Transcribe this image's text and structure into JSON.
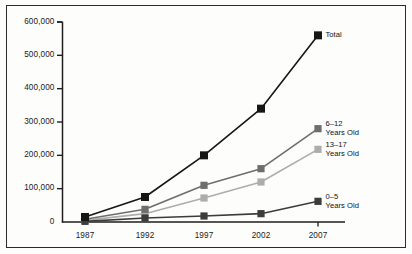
{
  "chart_data": {
    "type": "line",
    "title": "",
    "xlabel": "",
    "ylabel": "",
    "categories": [
      "1987",
      "1992",
      "1997",
      "2002",
      "2007"
    ],
    "x": [
      1987,
      1992,
      1997,
      2002,
      2007
    ],
    "ylim": [
      0,
      600000
    ],
    "xlim": [
      1985.6,
      2009.5
    ],
    "grid": false,
    "legend_position": "right-inline-endpoint-labels",
    "y_ticks": [
      0,
      100000,
      200000,
      300000,
      400000,
      500000,
      600000
    ],
    "y_tick_labels": [
      "0",
      "100,000",
      "200,000",
      "300,000",
      "400,000",
      "500,000",
      "600,000"
    ],
    "x_tick_labels": [
      "1987",
      "1992",
      "1997",
      "2002",
      "2007"
    ],
    "series": [
      {
        "name": "Total",
        "label_lines": [
          "Total"
        ],
        "color": "#161616",
        "marker": "square",
        "values": [
          15000,
          75000,
          200000,
          340000,
          560000
        ]
      },
      {
        "name": "6–12 Years Old",
        "label_lines": [
          "6–12",
          "Years Old"
        ],
        "color": "#6e6e6e",
        "marker": "square",
        "values": [
          8000,
          38000,
          110000,
          160000,
          280000
        ]
      },
      {
        "name": "13–17 Years Old",
        "label_lines": [
          "13–17",
          "Years Old"
        ],
        "color": "#adadad",
        "marker": "square",
        "values": [
          5000,
          25000,
          72000,
          120000,
          218000
        ]
      },
      {
        "name": "0–5 Years Old",
        "label_lines": [
          "0–5",
          "Years Old"
        ],
        "color": "#3c3c3c",
        "marker": "square",
        "values": [
          2000,
          12000,
          18000,
          25000,
          62000
        ]
      }
    ]
  },
  "axes": {
    "y_axis_name": "value-axis",
    "x_axis_name": "year-axis"
  }
}
